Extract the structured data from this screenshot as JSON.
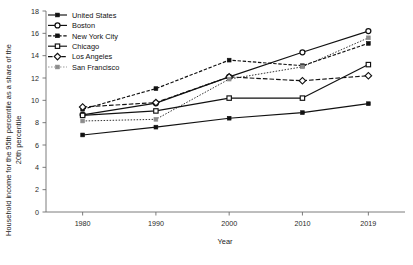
{
  "chart_data": {
    "type": "line",
    "title": "",
    "xlabel": "Year",
    "ylabel": "Household income for the 95th percentile as a share of the 20th percentile",
    "x": [
      1980,
      1990,
      2000,
      2010,
      2019
    ],
    "xtick_labels": [
      "1980",
      "1990",
      "2000",
      "2010",
      "2019"
    ],
    "ytick_labels": [
      "0",
      "2",
      "4",
      "6",
      "8",
      "10",
      "12",
      "14",
      "16",
      "18"
    ],
    "yticks": [
      0,
      2,
      4,
      6,
      8,
      10,
      12,
      14,
      16,
      18
    ],
    "ylim": [
      0,
      18
    ],
    "xlim": [
      1975,
      2024
    ],
    "grid": false,
    "legend_position": "top-left",
    "series": [
      {
        "name": "United States",
        "values": [
          6.9,
          7.6,
          8.4,
          8.9,
          9.7
        ],
        "linestyle": "solid",
        "marker": "square-filled",
        "color": "#111111"
      },
      {
        "name": "Boston",
        "values": [
          8.7,
          9.75,
          12.1,
          14.3,
          16.2
        ],
        "linestyle": "solid",
        "marker": "circle-open",
        "color": "#111111"
      },
      {
        "name": "New York City",
        "values": [
          9.2,
          11.05,
          13.6,
          13.1,
          15.1
        ],
        "linestyle": "dotted",
        "marker": "square-filled",
        "color": "#111111"
      },
      {
        "name": "Chicago",
        "values": [
          8.65,
          9.05,
          10.2,
          10.2,
          13.2
        ],
        "linestyle": "solid",
        "marker": "square-open",
        "color": "#111111"
      },
      {
        "name": "Los Angeles",
        "values": [
          9.4,
          9.8,
          12.1,
          11.75,
          12.2
        ],
        "linestyle": "dashed",
        "marker": "diamond-open",
        "color": "#111111"
      },
      {
        "name": "San Francisco",
        "values": [
          8.15,
          8.3,
          11.9,
          13.0,
          15.6
        ],
        "linestyle": "dotted-fine",
        "marker": "square-filled",
        "color": "#8c8c8c"
      }
    ]
  },
  "legend": {
    "items": [
      {
        "label": "United States"
      },
      {
        "label": "Boston"
      },
      {
        "label": "New York City"
      },
      {
        "label": "Chicago"
      },
      {
        "label": "Los Angeles"
      },
      {
        "label": "San Francisco"
      }
    ]
  },
  "axes": {
    "x_title": "Year",
    "y_title_line1": "Household income for the 95th percentile as a share of the",
    "y_title_line2": "20th percentile"
  }
}
